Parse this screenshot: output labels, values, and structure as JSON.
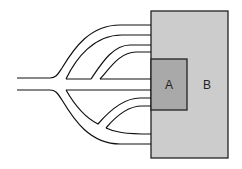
{
  "diagram": {
    "box_b": {
      "label": "B",
      "fill": "#cccccc",
      "stroke": "#222222"
    },
    "box_a": {
      "label": "A",
      "fill": "#a9a9a9",
      "stroke": "#222222"
    },
    "line_color": "#111111"
  }
}
